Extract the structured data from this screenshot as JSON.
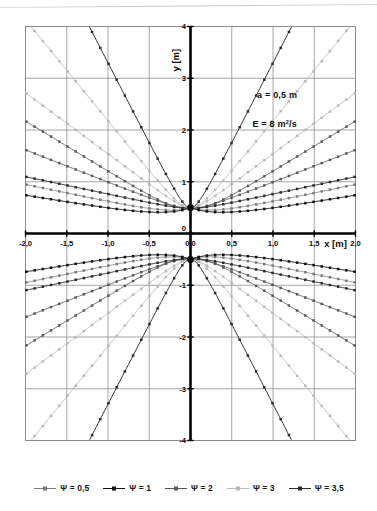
{
  "chart_data": {
    "type": "line",
    "title": "",
    "xlabel": "x  [m]",
    "ylabel": "y  [m]",
    "xlim": [
      -2.0,
      2.0
    ],
    "ylim": [
      -4.0,
      4.0
    ],
    "grid": true,
    "legend_position": "bottom",
    "x_ticks": [
      "-2,0",
      "-1,5",
      "-1,0",
      "-0,5",
      "0,0",
      "0,5",
      "1,0",
      "1,5",
      "2,0"
    ],
    "x_tick_values": [
      -2.0,
      -1.5,
      -1.0,
      -0.5,
      0.0,
      0.5,
      1.0,
      1.5,
      2.0
    ],
    "y_ticks": [
      "4",
      "3",
      "2",
      "1",
      "0",
      "-1",
      "-2",
      "-3",
      "-4"
    ],
    "y_tick_values": [
      4,
      3,
      2,
      1,
      0,
      -1,
      -2,
      -3,
      -4
    ],
    "annotations": [
      {
        "text": "a = 0,5  m",
        "x": 1.05,
        "y": 2.62
      },
      {
        "text": "E = 8  m²/s",
        "x": 1.02,
        "y": 2.05
      }
    ],
    "parameters": {
      "a": 0.5,
      "a_units": "m",
      "E": 8,
      "E_units": "m²/s"
    },
    "series": [
      {
        "name": "Ψ = 0,5",
        "color": "#7a7a7a",
        "marker": "square",
        "width": 0.8
      },
      {
        "name": "Ψ = 1",
        "color": "#111111",
        "marker": "square",
        "width": 1.0
      },
      {
        "name": "Ψ = 2",
        "color": "#5a5a5a",
        "marker": "square",
        "width": 0.9
      },
      {
        "name": "Ψ = 3",
        "color": "#b9b9b9",
        "marker": "square",
        "width": 0.9
      },
      {
        "name": "Ψ = 3,5",
        "color": "#2b2b2b",
        "marker": "square",
        "width": 1.0
      }
    ],
    "focal_points": [
      {
        "x": 0.0,
        "y": 0.5
      },
      {
        "x": 0.0,
        "y": -0.5
      }
    ]
  },
  "legend": {
    "items": [
      {
        "label": "Ψ = 0,5",
        "color": "#7a7a7a"
      },
      {
        "label": "Ψ = 1",
        "color": "#111111"
      },
      {
        "label": "Ψ = 2",
        "color": "#5a5a5a"
      },
      {
        "label": "Ψ = 3",
        "color": "#b9b9b9"
      },
      {
        "label": "Ψ = 3,5",
        "color": "#2b2b2b"
      }
    ]
  },
  "axes": {
    "x_label": "x  [m]",
    "y_label": "y  [m]"
  },
  "annotations": {
    "a_text": "a = 0,5  m",
    "E_text_pre": "E = 8  m",
    "E_text_sup": "2",
    "E_text_post": "/s"
  },
  "colors": {
    "frame": "#8c8c8c",
    "grid": "#8f8f8f",
    "axis": "#000000",
    "background": "#ffffff"
  }
}
